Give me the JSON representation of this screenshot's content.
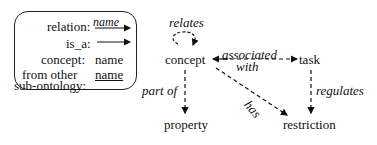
{
  "legend": {
    "relation_label": "relation:",
    "relation_value": "name",
    "is_a_label": "is_a:",
    "concept_label": "concept:",
    "concept_value": "name",
    "from_other_label_1": "from other",
    "from_other_label_2": "sub-ontology:",
    "from_other_value": "name"
  },
  "nodes": {
    "concept": "concept",
    "task": "task",
    "property": "property",
    "restriction": "restriction"
  },
  "edges": {
    "relates": "relates",
    "associated": "associated",
    "with": "with",
    "part_of": "part of",
    "has": "has",
    "regulates": "regulates"
  }
}
